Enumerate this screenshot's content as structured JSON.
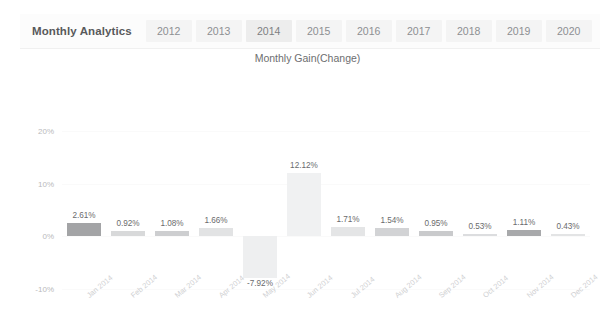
{
  "panel": {
    "title": "Monthly Analytics",
    "tabs": [
      {
        "label": "2012",
        "active": false
      },
      {
        "label": "2013",
        "active": false
      },
      {
        "label": "2014",
        "active": true
      },
      {
        "label": "2015",
        "active": false
      },
      {
        "label": "2016",
        "active": false
      },
      {
        "label": "2017",
        "active": false
      },
      {
        "label": "2018",
        "active": false
      },
      {
        "label": "2019",
        "active": false
      },
      {
        "label": "2020",
        "active": false
      }
    ]
  },
  "chart_data": {
    "type": "bar",
    "title": "Monthly Gain(Change)",
    "xlabel": "",
    "ylabel": "",
    "ylim": [
      -10,
      20
    ],
    "yticks": [
      "-10%",
      "0%",
      "10%",
      "20%"
    ],
    "ytick_values": [
      -10,
      0,
      10,
      20
    ],
    "grid": true,
    "legend": "none",
    "categories": [
      "Jan 2014",
      "Feb 2014",
      "Mar 2014",
      "Apr 2014",
      "May 2014",
      "Jun 2014",
      "Jul 2014",
      "Aug 2014",
      "Sep 2014",
      "Oct 2014",
      "Nov 2014",
      "Dec 2014"
    ],
    "values": [
      2.61,
      0.92,
      1.08,
      1.66,
      -7.92,
      12.12,
      1.71,
      1.54,
      0.95,
      0.53,
      1.11,
      0.43
    ],
    "data_labels": [
      "2.61%",
      "0.92%",
      "1.08%",
      "1.66%",
      "-7.92%",
      "12.12%",
      "1.71%",
      "1.54%",
      "0.95%",
      "0.53%",
      "1.11%",
      "0.43%"
    ],
    "bar_colors": [
      "#a3a4a6",
      "#d8d9da",
      "#cdced0",
      "#e2e3e4",
      "#eeeff0",
      "#f0f1f2",
      "#e4e5e6",
      "#d2d3d5",
      "#c9cacc",
      "#dcdddf",
      "#a8a9ab",
      "#e3e4e5"
    ],
    "accent_color": "#a3a4a6",
    "label_color": "#6a6b6d",
    "axis_color": "#b9babc"
  }
}
